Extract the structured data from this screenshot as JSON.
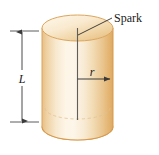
{
  "figure": {
    "name": "spark-cylinder-diagram",
    "background_color": "#ffffff",
    "labels": {
      "spark": "Spark",
      "length": "L",
      "radius": "r"
    },
    "colors": {
      "body_edge_left": "#e8c48e",
      "body_mid_highlight": "#fdf4e2",
      "body_edge_right": "#e0a860",
      "top_face_light": "#fbf0d8",
      "top_face_dark": "#edc48c",
      "outline": "#d9a55f",
      "axis_line": "#5a5a5a",
      "leader_line": "#333333",
      "dimension_line": "#4a4a4a",
      "hidden_edge": "#dfc49a",
      "text": "#1a1a1a"
    },
    "geometry": {
      "cylinder_left_x": 42,
      "cylinder_right_x": 113,
      "cylinder_center_x": 77.5,
      "cylinder_radius_x": 35.5,
      "top_ellipse_center_y": 28,
      "top_ellipse_radius_y": 13,
      "bottom_ellipse_center_y": 127,
      "bottom_ellipse_radius_y": 13,
      "hidden_ellipse_center_y": 108,
      "hidden_ellipse_radius_y": 11,
      "axis_top_y": 28,
      "axis_bottom_y": 120,
      "radius_arrow_y": 79,
      "radius_arrow_end_x": 115,
      "dimension_x": 22,
      "dimension_top_y": 31,
      "dimension_bottom_y": 122,
      "tick_left_x": 10,
      "tick_right_x": 39,
      "spark_line_start_x": 78,
      "spark_line_start_y": 35,
      "spark_line_end_x": 111,
      "spark_line_end_y": 19,
      "spark_label_x": 114,
      "spark_label_y": 22
    }
  }
}
